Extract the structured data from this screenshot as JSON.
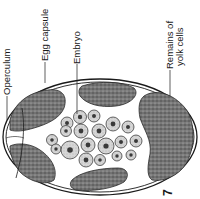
{
  "figure": {
    "type": "labeled biological diagram",
    "labels": [
      {
        "id": "operculum",
        "text": "Operculum"
      },
      {
        "id": "egg-capsule",
        "text": "Egg capsule"
      },
      {
        "id": "embryo",
        "text": "Embryo"
      },
      {
        "id": "yolk",
        "text": "Remains of",
        "text2": "yolk cells"
      }
    ],
    "corner_mark": "7"
  },
  "colors": {
    "ink": "#1a1a1a",
    "yolk_fill": "#6e6e6e",
    "cell_fill": "#c8c8c8",
    "nucleus": "#3a3a3a",
    "background": "#ffffff"
  }
}
